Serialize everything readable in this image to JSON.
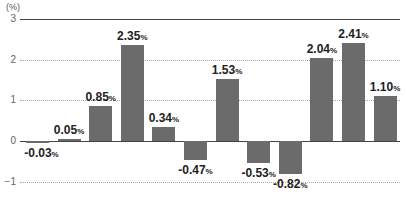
{
  "chart_data": {
    "type": "bar",
    "title": "",
    "xlabel": "",
    "ylabel": "(%)",
    "ylim": [
      -1,
      3
    ],
    "yticks": [
      3,
      2,
      1,
      0,
      -1
    ],
    "ytick_labels": [
      "3",
      "2",
      "1",
      "0",
      "−1"
    ],
    "grid": true,
    "legend": null,
    "categories": [
      "1",
      "2",
      "3",
      "4",
      "5",
      "6",
      "7",
      "8",
      "9",
      "10",
      "11",
      "12"
    ],
    "values": [
      -0.03,
      0.05,
      0.85,
      2.35,
      0.34,
      -0.47,
      1.53,
      -0.53,
      -0.82,
      2.04,
      2.41,
      1.1
    ],
    "value_labels": [
      "-0.03",
      "0.05",
      "0.85",
      "2.35",
      "0.34",
      "-0.47",
      "1.53",
      "-0.53",
      "-0.82",
      "2.04",
      "2.41",
      "1.10"
    ],
    "label_suffix": "%",
    "bar_color": "#6b6b6b"
  }
}
